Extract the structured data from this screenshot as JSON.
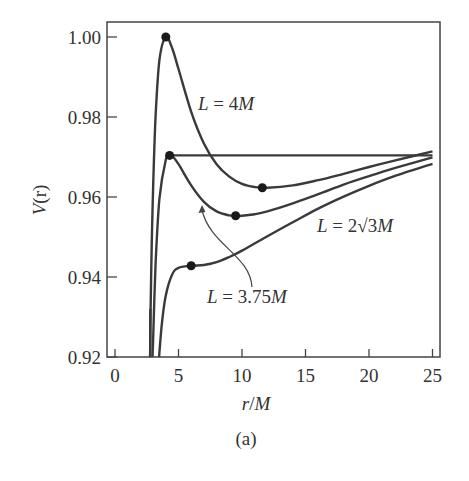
{
  "chart_data": {
    "type": "line",
    "title": "",
    "caption": "(a)",
    "xlabel": "r/M",
    "ylabel": "V(r)",
    "xlim": [
      -0.6,
      25.6
    ],
    "ylim": [
      0.92,
      1.004
    ],
    "xticks": [
      0,
      5,
      10,
      15,
      20,
      25
    ],
    "xtick_labels": [
      "0",
      "5",
      "10",
      "15",
      "20",
      "25"
    ],
    "yticks": [
      0.92,
      0.94,
      0.96,
      0.98,
      1.0
    ],
    "ytick_labels": [
      "0.92",
      "0.94",
      "0.96",
      "0.98",
      "1.00"
    ],
    "grid": false,
    "legend": null,
    "series": [
      {
        "name": "L = 4M",
        "x": [
          2.8,
          2.9,
          3.0,
          3.2,
          3.5,
          4.0,
          4.5,
          5,
          6,
          7,
          8,
          9,
          10,
          11,
          12,
          14,
          16,
          18,
          20,
          22,
          25
        ],
        "y": [
          0.932,
          0.9491,
          0.9622,
          0.9803,
          0.9942,
          1.0,
          0.9972,
          0.992,
          0.9813,
          0.9734,
          0.9682,
          0.9651,
          0.9633,
          0.9625,
          0.9623,
          0.9629,
          0.9642,
          0.9658,
          0.9675,
          0.9691,
          0.9714
        ],
        "markers": [
          {
            "x": 4.0,
            "y": 1.0
          },
          {
            "x": 11.6,
            "y": 0.9623
          }
        ]
      },
      {
        "name": "L = 3.75M",
        "x": [
          2.95,
          3.0,
          3.2,
          3.5,
          4.0,
          4.3,
          4.5,
          5,
          6,
          7,
          8,
          9,
          9.5,
          10,
          11,
          12,
          14,
          16,
          18,
          20,
          22,
          25
        ],
        "y": [
          0.92,
          0.9242,
          0.9434,
          0.9595,
          0.9693,
          0.9704,
          0.9703,
          0.9682,
          0.9629,
          0.9588,
          0.9564,
          0.9554,
          0.9553,
          0.9553,
          0.9557,
          0.9564,
          0.9584,
          0.9607,
          0.9631,
          0.9652,
          0.9672,
          0.9699
        ],
        "markers": [
          {
            "x": 4.3,
            "y": 0.9704
          },
          {
            "x": 9.5,
            "y": 0.9553
          }
        ]
      },
      {
        "name": "L = 2√3M",
        "x": [
          3.48,
          3.5,
          3.7,
          4.0,
          4.5,
          5,
          6,
          7,
          8,
          9,
          10,
          12,
          14,
          16,
          18,
          20,
          22,
          25
        ],
        "y": [
          0.92,
          0.9211,
          0.9286,
          0.9354,
          0.9406,
          0.9423,
          0.9428,
          0.943,
          0.9437,
          0.945,
          0.9466,
          0.9502,
          0.9537,
          0.9571,
          0.9601,
          0.9628,
          0.9652,
          0.9683
        ],
        "markers": [
          {
            "x": 6.0,
            "y": 0.9428
          }
        ]
      },
      {
        "name": "energy level (L = 3.75M peak)",
        "x": [
          4.3,
          25
        ],
        "y": [
          0.9704,
          0.9704
        ],
        "markers": []
      }
    ],
    "annotations": [
      {
        "text": "L = 4M",
        "x": 9.2,
        "y": 0.9828
      },
      {
        "text": "L = 2√3M",
        "x": 19.8,
        "y": 0.9533
      },
      {
        "text": "L = 3.75M",
        "x": 11.8,
        "y": 0.9345,
        "arrow_to": {
          "x": 6.8,
          "y": 0.9562
        }
      }
    ]
  },
  "labels": {
    "xlabel_r": "r",
    "xlabel_slash": "/",
    "xlabel_M": "M",
    "ylabel_V": "V",
    "ylabel_r": "(r)",
    "ann_4_L": "L",
    "ann_4_rest": " = 4",
    "ann_4_M": "M",
    "ann_2r3_L": "L",
    "ann_2r3_rest": " = 2√3",
    "ann_2r3_M": "M",
    "ann_375_L": "L",
    "ann_375_rest": " = 3.75",
    "ann_375_M": "M",
    "caption": "(a)"
  }
}
